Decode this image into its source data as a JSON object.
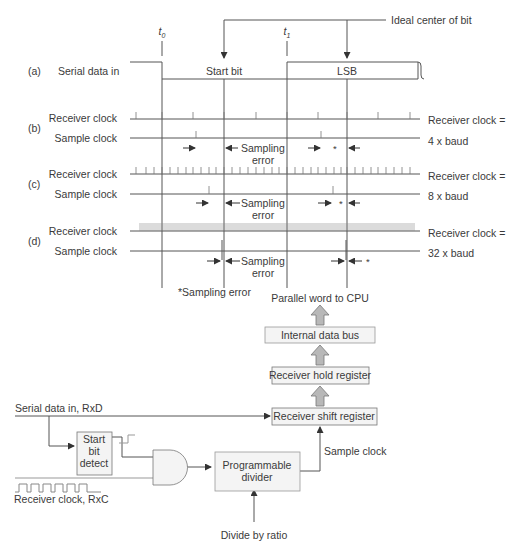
{
  "timing": {
    "t0": "t",
    "t0_sub": "0",
    "t1": "t",
    "t1_sub": "1",
    "ideal_center": "Ideal center of bit",
    "row_a": {
      "tag": "(a)",
      "label": "Serial data in",
      "start_bit": "Start bit",
      "lsb": "LSB"
    },
    "row_b": {
      "tag": "(b)",
      "rx_label": "Receiver clock",
      "sample_label": "Sample clock",
      "note1": "Receiver clock =",
      "note2": "4 x baud"
    },
    "row_c": {
      "tag": "(c)",
      "rx_label": "Receiver clock",
      "sample_label": "Sample clock",
      "note1": "Receiver clock =",
      "note2": "8 x baud"
    },
    "row_d": {
      "tag": "(d)",
      "rx_label": "Receiver clock",
      "sample_label": "Sample clock",
      "note1": "Receiver clock =",
      "note2": "32 x baud"
    },
    "sampling": "Sampling",
    "error": "error",
    "asterisk": "*",
    "footnote": "*Sampling error"
  },
  "block": {
    "parallel_word": "Parallel word to CPU",
    "internal_bus": "Internal data bus",
    "hold_register": "Receiver hold register",
    "shift_register": "Receiver shift register",
    "serial_in": "Serial data in, RxD",
    "start_bit_1": "Start",
    "start_bit_2": "bit",
    "start_bit_3": "detect",
    "receiver_clock": "Receiver clock,  RxC",
    "divider_1": "Programmable",
    "divider_2": "divider",
    "sample_clock": "Sample clock",
    "divide_ratio": "Divide by ratio"
  },
  "colors": {
    "line": "#555555",
    "box_fill": "#f4f4f4",
    "arrow_fill": "#b8b8b8"
  }
}
